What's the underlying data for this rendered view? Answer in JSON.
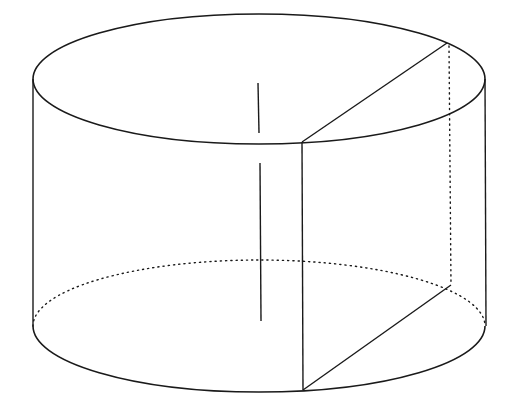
{
  "diagram": {
    "title": "",
    "type": "cylinder-with-axial-cross-section",
    "stroke_color": "#1a1a1a",
    "background": "#ffffff",
    "top_ellipse": {
      "cx": 259,
      "cy": 79,
      "rx": 226,
      "ry": 65
    },
    "bottom_ellipse": {
      "cx": 259,
      "cy": 326,
      "rx": 226,
      "ry": 66
    },
    "side_lines": [
      {
        "x1": 33,
        "y1": 79,
        "x2": 33,
        "y2": 326
      },
      {
        "x1": 485,
        "y1": 79,
        "x2": 486,
        "y2": 326
      }
    ],
    "axis_segments": [
      {
        "x1": 258,
        "y1": 83,
        "x2": 259,
        "y2": 133
      },
      {
        "x1": 260,
        "y1": 163,
        "x2": 261,
        "y2": 321
      }
    ],
    "section_solid": [
      {
        "x1": 302,
        "y1": 142,
        "x2": 447,
        "y2": 43
      },
      {
        "x1": 302,
        "y1": 142,
        "x2": 303,
        "y2": 390
      },
      {
        "x1": 303,
        "y1": 390,
        "x2": 451,
        "y2": 285
      }
    ],
    "section_dotted": [
      {
        "x1": 449,
        "y1": 46,
        "x2": 451,
        "y2": 285
      }
    ],
    "labels": []
  }
}
